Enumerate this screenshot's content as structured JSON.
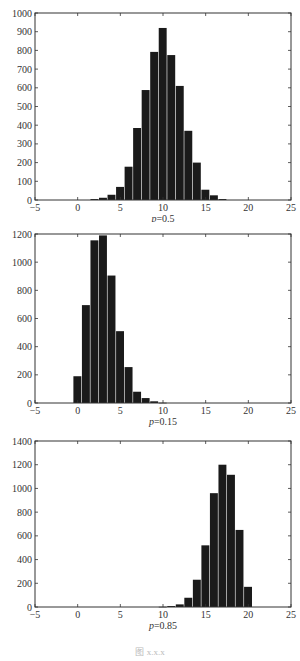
{
  "figure_caption": "图 x.x.x",
  "chart_data": [
    {
      "type": "bar",
      "title": "",
      "subcaption_var": "p",
      "subcaption_val": "=0.5",
      "xlabel": "p=0.5",
      "ylabel": "",
      "xlim": [
        -5,
        25
      ],
      "ylim": [
        0,
        1000
      ],
      "xticks": [
        -5,
        0,
        5,
        10,
        15,
        20,
        25
      ],
      "yticks": [
        0,
        100,
        200,
        300,
        400,
        500,
        600,
        700,
        800,
        900,
        1000
      ],
      "grid": false,
      "bar_color": "#1a1a1a",
      "categories": [
        2,
        3,
        4,
        5,
        6,
        7,
        8,
        9,
        10,
        11,
        12,
        13,
        14,
        15,
        16,
        17
      ],
      "values": [
        5,
        12,
        28,
        70,
        178,
        385,
        588,
        792,
        920,
        775,
        610,
        370,
        200,
        55,
        25,
        5
      ]
    },
    {
      "type": "bar",
      "title": "",
      "subcaption_var": "p",
      "subcaption_val": "=0.15",
      "xlabel": "p=0.15",
      "ylabel": "",
      "xlim": [
        -5,
        25
      ],
      "ylim": [
        0,
        1200
      ],
      "xticks": [
        -5,
        0,
        5,
        10,
        15,
        20,
        25
      ],
      "yticks": [
        0,
        200,
        400,
        600,
        800,
        1000,
        1200
      ],
      "grid": false,
      "bar_color": "#1a1a1a",
      "categories": [
        0,
        1,
        2,
        3,
        4,
        5,
        6,
        7,
        8,
        9,
        10
      ],
      "values": [
        190,
        695,
        1155,
        1190,
        905,
        510,
        255,
        80,
        35,
        12,
        2
      ]
    },
    {
      "type": "bar",
      "title": "",
      "subcaption_var": "p",
      "subcaption_val": "=0.85",
      "xlabel": "p=0.85",
      "ylabel": "",
      "xlim": [
        -5,
        25
      ],
      "ylim": [
        0,
        1400
      ],
      "xticks": [
        -5,
        0,
        5,
        10,
        15,
        20,
        25
      ],
      "yticks": [
        0,
        200,
        400,
        600,
        800,
        1000,
        1200,
        1400
      ],
      "grid": false,
      "bar_color": "#1a1a1a",
      "categories": [
        10,
        11,
        12,
        13,
        14,
        15,
        16,
        17,
        18,
        19,
        20
      ],
      "values": [
        2,
        8,
        22,
        78,
        230,
        520,
        960,
        1200,
        1115,
        650,
        170
      ]
    }
  ]
}
